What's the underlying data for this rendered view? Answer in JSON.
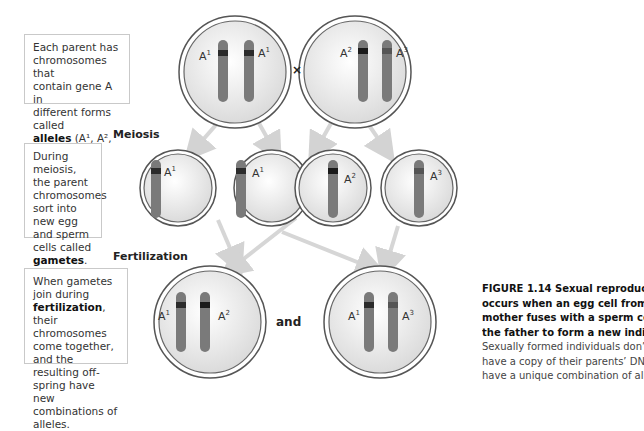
{
  "boxes": {
    "alleles": {
      "line1": "Each parent has",
      "line2": "chromosomes that",
      "line3": "contain gene A in",
      "line4": "different forms called",
      "bold": "alleles",
      "rest": " (A¹, A², A³)."
    },
    "meiosis": {
      "text": "During meiosis, the parent chromosomes sort into new egg and sperm cells called ",
      "bold": "gametes",
      "end": "."
    },
    "fertilization": {
      "pre": "When gametes join during ",
      "bold": "fertilization",
      "post": ", their chromosomes come together, and the resulting off-spring have new combinations of alleles."
    }
  },
  "labels": {
    "meiosis": "Meiosis",
    "fertilization": "Fertilization",
    "cross": "×",
    "and": "and"
  },
  "caption": {
    "bold_lines": [
      "FIGURE 1.14  Sexual reproduction",
      "occurs when an egg cell from the",
      "mother fuses with a sperm cell from",
      "the father to form a new individual."
    ],
    "plain_lines": [
      "Sexually formed individuals don’t just",
      "have a copy of their parents’ DNA: they",
      "have a unique combination of alleles."
    ]
  },
  "cells": {
    "parent1": [
      "A1",
      "A1"
    ],
    "parent2": [
      "A2",
      "A3"
    ],
    "gametes": [
      "A1",
      "A1",
      "A2",
      "A3"
    ],
    "offspring1": [
      "A1",
      "A2"
    ],
    "offspring2": [
      "A1",
      "A3"
    ]
  },
  "colors": {
    "chromosome": "#7a7a7a",
    "band": "#2b2b2b",
    "cell_ring": "#555555",
    "arrow": "#d3d3d3"
  }
}
